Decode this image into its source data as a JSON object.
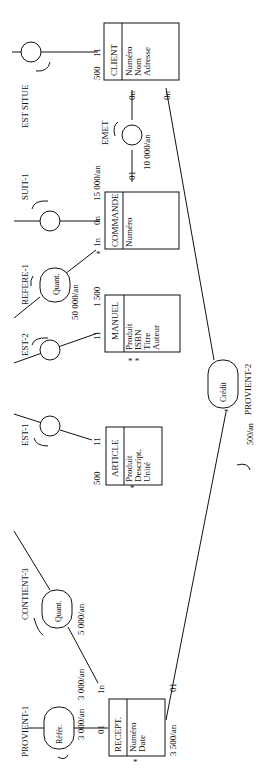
{
  "diagram": {
    "type": "MCD (entity-relationship, rotated 90°)",
    "entities": {
      "client": {
        "name": "CLIENT",
        "attrs": [
          "Numéro",
          "Nom",
          "Adresse"
        ],
        "volume": "500",
        "card_left": "11"
      },
      "commande": {
        "name": "COMMANDE",
        "attrs": [
          "Numéro"
        ],
        "volume": "15 000/an"
      },
      "manuel": {
        "name": "MANUEL",
        "attrs": [
          "Produit",
          "ISBN",
          "Titre",
          "Auteur"
        ],
        "volume": "1 500"
      },
      "article": {
        "name": "ARTICLE",
        "attrs": [
          "Produit",
          "Descript.",
          "Unité"
        ],
        "volume": "500"
      },
      "recept": {
        "name": "RECEPT.",
        "attrs": [
          "Numéro",
          "Date"
        ],
        "volume": "3 500/an"
      }
    },
    "relations": {
      "est_situe": {
        "name": "EST SITUE"
      },
      "emet": {
        "name": "EMET",
        "volume": "10 000/an"
      },
      "suit1": {
        "name": "SUIT-1"
      },
      "refere1": {
        "name": "REFERE-1",
        "prop": "Quant.",
        "volume": "50 000/an"
      },
      "est2": {
        "name": "EST-2"
      },
      "est1": {
        "name": "EST-1"
      },
      "provient2": {
        "name": "PROVIENT-2",
        "prop": "Crédit",
        "volume": "500/an"
      },
      "contient3": {
        "name": "CONTIENT-3",
        "prop": "Quant.",
        "volume": "5 000/an"
      },
      "provient1": {
        "name": "PROVIENT-1",
        "prop": "Référ.",
        "volume": "3 000/an"
      }
    },
    "cardinalities": {
      "client_emet": "0n",
      "client_provient2": "0n",
      "commande_emet": "01",
      "commande_suit": "0n",
      "commande_refere": "1n",
      "manuel_est2": "11",
      "article_est1": "11",
      "recept_contient": "1n",
      "recept_provient1": "01",
      "recept_provient2": "01",
      "client_est_situe": "11"
    },
    "extra_volumes": {
      "contient_recept": "3 000/an"
    }
  }
}
